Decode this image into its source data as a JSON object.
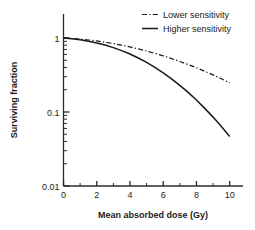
{
  "chart_data": {
    "type": "line",
    "title": "",
    "xlabel": "Mean absorbed dose (Gy)",
    "ylabel": "Surviving fraction",
    "xlim": [
      0,
      10.8
    ],
    "ylim": [
      0.01,
      1
    ],
    "yscale": "log",
    "grid": false,
    "legend_position": "top-right",
    "x_ticks_major": [
      0,
      2,
      4,
      6,
      8,
      10
    ],
    "x_tick_labels": [
      "0",
      "2",
      "4",
      "6",
      "8",
      "10"
    ],
    "x_ticks_minor": [
      1,
      3,
      5,
      7,
      9
    ],
    "y_ticks_major": [
      1,
      0.1,
      0.01
    ],
    "y_tick_labels": [
      "1",
      "0.1",
      "0.01"
    ],
    "y_ticks_minor": [
      0.9,
      0.8,
      0.7,
      0.6,
      0.5,
      0.4,
      0.3,
      0.2,
      0.09,
      0.08,
      0.07,
      0.06,
      0.05,
      0.04,
      0.03,
      0.02
    ],
    "x": [
      0,
      0.5,
      1,
      1.5,
      2,
      2.5,
      3,
      3.5,
      4,
      4.5,
      5,
      5.5,
      6,
      6.5,
      7,
      7.5,
      8,
      8.5,
      9,
      9.5,
      10
    ],
    "series": [
      {
        "name": "Lower sensitivity",
        "style": "dash-dot",
        "color": "#1a1a1a",
        "values": [
          1.0,
          0.985,
          0.965,
          0.94,
          0.912,
          0.878,
          0.84,
          0.8,
          0.757,
          0.712,
          0.666,
          0.62,
          0.573,
          0.527,
          0.482,
          0.438,
          0.396,
          0.355,
          0.317,
          0.281,
          0.248
        ]
      },
      {
        "name": "Higher sensitivity",
        "style": "solid",
        "color": "#1a1a1a",
        "values": [
          1.0,
          0.975,
          0.945,
          0.905,
          0.858,
          0.803,
          0.742,
          0.676,
          0.607,
          0.537,
          0.468,
          0.401,
          0.338,
          0.281,
          0.229,
          0.184,
          0.145,
          0.112,
          0.0853,
          0.0637,
          0.0466
        ]
      }
    ],
    "legend": [
      {
        "label": "Lower sensitivity",
        "style": "dash-dot"
      },
      {
        "label": "Higher sensitivity",
        "style": "solid"
      }
    ]
  }
}
